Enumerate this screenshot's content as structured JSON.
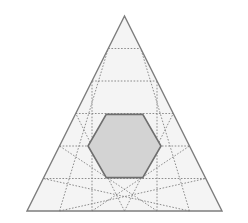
{
  "figure": {
    "canvas": {
      "width": 248,
      "height": 223,
      "background": "#ffffff"
    }
  },
  "chart_data": {
    "type": "diagram",
    "title": "",
    "subtitle": "",
    "xlabel": "",
    "ylabel": "",
    "grid": true,
    "legend": null,
    "annotations": [],
    "geometry": {
      "outer_triangle": {
        "name": "outer-triangle",
        "vertices": [
          [
            124.5,
            16
          ],
          [
            27,
            211
          ],
          [
            222,
            211
          ]
        ],
        "side_divisions": 6,
        "small_triangle_count": 36,
        "fill": "#f4f4f4",
        "stroke": "#7d7d7d",
        "stroke_width": 1.4,
        "stroke_style": "solid"
      },
      "grid_lines": {
        "name": "triangular-grid",
        "stroke": "#808080",
        "stroke_width": 0.9,
        "stroke_style": "dotted",
        "dash_pattern": "1.6 1.6",
        "directions": [
          "horizontal",
          "left-leaning",
          "right-leaning"
        ],
        "rows": 6,
        "row_y_values": [
          16,
          48.5,
          81,
          113.5,
          146,
          178.5,
          211
        ]
      },
      "hexagon": {
        "name": "central-hexagon",
        "regular": true,
        "center": [
          124.5,
          146
        ],
        "circumradius": 36.5,
        "vertices": [
          [
            106.25,
            114.4
          ],
          [
            142.75,
            114.4
          ],
          [
            161,
            146
          ],
          [
            142.75,
            177.6
          ],
          [
            106.25,
            177.6
          ],
          [
            88,
            146
          ]
        ],
        "fill": "#d3d3d3",
        "stroke": "#6e6e6e",
        "stroke_width": 1.6,
        "stroke_style": "solid",
        "covered_small_triangles": 6
      }
    },
    "palette": {
      "background": "#ffffff",
      "triangle_fill": "#f4f4f4",
      "triangle_stroke": "#7d7d7d",
      "grid_stroke": "#808080",
      "hexagon_fill": "#d3d3d3",
      "hexagon_stroke": "#6e6e6e"
    }
  }
}
